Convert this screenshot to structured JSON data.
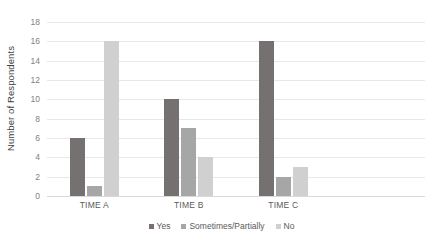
{
  "chart_data": {
    "type": "bar",
    "title": "",
    "subtitle": "",
    "xlabel": "",
    "ylabel": "Number of Respondents",
    "categories": [
      "TIME A",
      "TIME B",
      "TIME C"
    ],
    "series": [
      {
        "name": "Yes",
        "values": [
          6,
          10,
          16
        ],
        "color": "#767171"
      },
      {
        "name": "Sometimes/Partially",
        "values": [
          1,
          7,
          2
        ],
        "color": "#a6a6a6"
      },
      {
        "name": "No",
        "values": [
          16,
          4,
          3
        ],
        "color": "#d0d0d0"
      }
    ],
    "ylim": [
      0,
      18
    ],
    "ytick_step": 2,
    "yticks": [
      0,
      2,
      4,
      6,
      8,
      10,
      12,
      14,
      16,
      18
    ],
    "ytick_labels": [
      "0",
      "2",
      "4",
      "6",
      "8",
      "10",
      "12",
      "14",
      "16",
      "18"
    ],
    "grid": true,
    "grid_axis": "y",
    "legend": true,
    "legend_position": "bottom",
    "background": "#ffffff",
    "gridline_color": "#e8e8e8",
    "axis_text_color": "#7f7f7f"
  }
}
